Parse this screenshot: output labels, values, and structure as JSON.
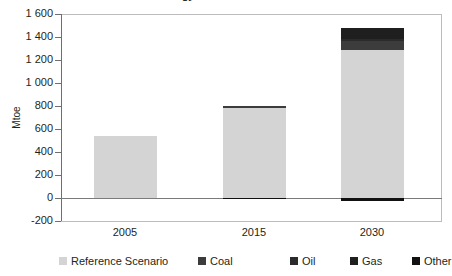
{
  "chart_data": {
    "type": "bar",
    "stacked": true,
    "title": "Energy Demand Variants",
    "xlabel": "",
    "ylabel": "Mtoe",
    "categories": [
      "2005",
      "2015",
      "2030"
    ],
    "ylim": [
      -200,
      1600
    ],
    "ytick_step": 200,
    "ytick_labels": [
      "1 600",
      "1 400",
      "1 200",
      "1 000",
      "800",
      "600",
      "400",
      "200",
      "0",
      "-200"
    ],
    "ytick_values": [
      1600,
      1400,
      1200,
      1000,
      800,
      600,
      400,
      200,
      0,
      -200
    ],
    "grid": false,
    "legend_position": "bottom",
    "series": [
      {
        "name": "Reference Scenario",
        "color": "#d4d4d4",
        "values": [
          540,
          780,
          1290
        ]
      },
      {
        "name": "Coal",
        "color": "#3c3c3c",
        "values": [
          0,
          18,
          75
        ]
      },
      {
        "name": "Oil",
        "color": "#2b2b2b",
        "values": [
          0,
          0,
          18
        ]
      },
      {
        "name": "Gas",
        "color": "#1f1f1f",
        "values": [
          0,
          0,
          95
        ]
      },
      {
        "name": "Other",
        "color": "#111111",
        "values": [
          0,
          -8,
          -30
        ]
      }
    ],
    "totals_positive": [
      540,
      798,
      1478
    ]
  },
  "legend": {
    "items": [
      {
        "label": "Reference Scenario",
        "color": "#d4d4d4"
      },
      {
        "label": "Coal",
        "color": "#3c3c3c"
      },
      {
        "label": "Oil",
        "color": "#2b2b2b"
      },
      {
        "label": "Gas",
        "color": "#1f1f1f"
      },
      {
        "label": "Other",
        "color": "#111111"
      }
    ]
  },
  "colors": {
    "axis": "#6f6f6f",
    "frame": "#bcbcbc",
    "text": "#231f20",
    "background": "#ffffff"
  }
}
